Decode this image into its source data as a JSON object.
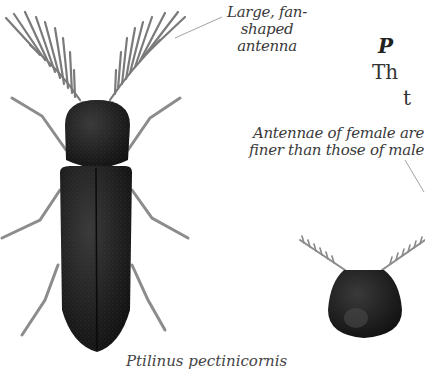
{
  "figure": {
    "male_beetle": {
      "label_antenna": [
        "Large, fan-",
        "shaped",
        "antenna"
      ]
    },
    "female_head": {
      "label": [
        "Antennae of female are",
        "finer than those of male"
      ]
    },
    "caption": "Ptilinus pectinicornis"
  },
  "side_text": {
    "heading_fragment": "P",
    "line1_fragment": "Th",
    "line2_fragment": "t"
  },
  "colors": {
    "body": "#1c1c1c",
    "legs": "#8c8c8c",
    "text": "#3a3a3a",
    "background": "#ffffff"
  }
}
